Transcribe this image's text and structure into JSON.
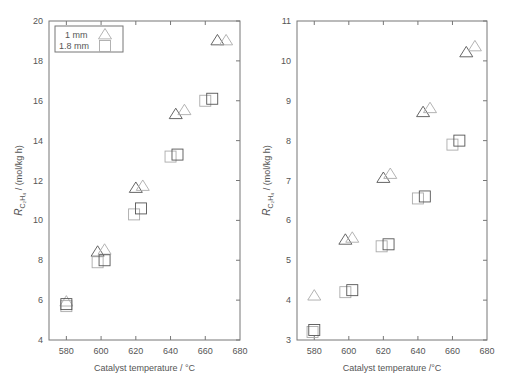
{
  "chart_data": [
    {
      "type": "scatter",
      "panel": "left",
      "title": "",
      "xlabel": "Catalyst temperature / °C",
      "ylabel_main": "R",
      "ylabel_sub": "C₂H₄",
      "ylabel_unit": " / (mol/kg h)",
      "xlim": [
        570,
        680
      ],
      "ylim": [
        4,
        20
      ],
      "xticks": [
        580,
        600,
        620,
        640,
        660,
        680
      ],
      "yticks": [
        4,
        6,
        8,
        10,
        12,
        14,
        16,
        18,
        20
      ],
      "legend": {
        "position": "upper-left",
        "entries": [
          {
            "label": "1 mm",
            "marker": "triangle"
          },
          {
            "label": "1.8 mm",
            "marker": "square"
          }
        ]
      },
      "series": [
        {
          "name": "1 mm",
          "marker": "triangle",
          "points": [
            [
              580,
              5.9
            ],
            [
              598,
              8.4
            ],
            [
              602,
              8.5
            ],
            [
              620,
              11.6
            ],
            [
              624,
              11.7
            ],
            [
              643,
              15.3
            ],
            [
              648,
              15.5
            ],
            [
              667,
              19.0
            ],
            [
              672,
              19.0
            ]
          ]
        },
        {
          "name": "1.8 mm",
          "marker": "square",
          "points": [
            [
              580,
              5.7
            ],
            [
              580,
              5.8
            ],
            [
              598,
              7.9
            ],
            [
              602,
              8.0
            ],
            [
              619,
              10.3
            ],
            [
              623,
              10.6
            ],
            [
              640,
              13.2
            ],
            [
              644,
              13.3
            ],
            [
              660,
              16.0
            ],
            [
              664,
              16.1
            ]
          ]
        }
      ]
    },
    {
      "type": "scatter",
      "panel": "right",
      "title": "",
      "xlabel": "Catalyst temperature /°C",
      "ylabel_main": "R",
      "ylabel_sub": "C₂H₄",
      "ylabel_unit": " / (mol/kg h)",
      "xlim": [
        570,
        680
      ],
      "ylim": [
        3,
        11
      ],
      "xticks": [
        580,
        600,
        620,
        640,
        660,
        680
      ],
      "yticks": [
        3,
        4,
        5,
        6,
        7,
        8,
        9,
        10,
        11
      ],
      "series": [
        {
          "name": "1 mm",
          "marker": "triangle",
          "points": [
            [
              580,
              4.1
            ],
            [
              598,
              5.5
            ],
            [
              602,
              5.55
            ],
            [
              620,
              7.05
            ],
            [
              624,
              7.15
            ],
            [
              643,
              8.7
            ],
            [
              647,
              8.8
            ],
            [
              668,
              10.2
            ],
            [
              673,
              10.35
            ]
          ]
        },
        {
          "name": "1.8 mm",
          "marker": "square",
          "points": [
            [
              579,
              3.2
            ],
            [
              580,
              3.25
            ],
            [
              598,
              4.2
            ],
            [
              602,
              4.25
            ],
            [
              619,
              5.35
            ],
            [
              623,
              5.4
            ],
            [
              640,
              6.55
            ],
            [
              644,
              6.6
            ],
            [
              660,
              7.9
            ],
            [
              664,
              8.0
            ]
          ]
        }
      ]
    }
  ],
  "panels": [
    {
      "x0": 49,
      "x1": 240,
      "y0": 21,
      "y1": 340
    },
    {
      "x0": 297,
      "x1": 487,
      "y0": 21,
      "y1": 340
    }
  ],
  "colors": {
    "axis": "#777777",
    "marker_light": "#aaaaaa",
    "marker_dark": "#555555",
    "text": "#555555"
  }
}
